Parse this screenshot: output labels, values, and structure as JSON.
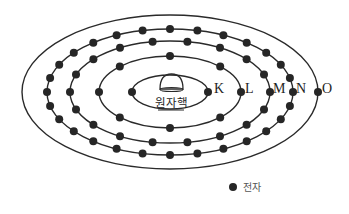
{
  "diagram": {
    "center": {
      "x": 170,
      "y": 92
    },
    "nucleus": {
      "label": "원자핵",
      "icon": "nucleus-dome-icon"
    },
    "shells": [
      {
        "name": "K",
        "label": "K",
        "rx": 38,
        "ry": 17,
        "electrons": 2,
        "label_x": 214,
        "label_y": 93
      },
      {
        "name": "L",
        "label": "L",
        "rx": 71,
        "ry": 36,
        "electrons": 8,
        "label_x": 245,
        "label_y": 93
      },
      {
        "name": "M",
        "label": "M",
        "rx": 100,
        "ry": 51,
        "electrons": 18,
        "label_x": 273,
        "label_y": 93
      },
      {
        "name": "N",
        "label": "N",
        "rx": 123,
        "ry": 63,
        "electrons": 28,
        "label_x": 296,
        "label_y": 93
      },
      {
        "name": "O",
        "label": "O",
        "rx": 148,
        "ry": 77,
        "electrons": 1,
        "label_x": 322,
        "label_y": 93
      }
    ],
    "colors": {
      "stroke": "#2a2a2a",
      "electron": "#262626",
      "background": "#ffffff"
    }
  },
  "legend": {
    "symbol": "electron-dot-icon",
    "label": "전자"
  }
}
